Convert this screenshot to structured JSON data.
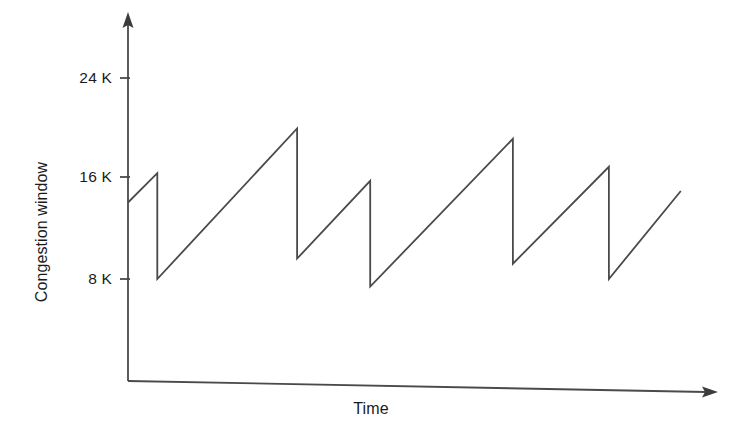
{
  "chart_data": {
    "type": "line",
    "title": "",
    "subtitle": "",
    "xlabel": "Time",
    "ylabel": "Congestion window",
    "grid": false,
    "legend": null,
    "legend_position": "none",
    "x": [
      0,
      0.05,
      0.05,
      0.289,
      0.289,
      0.414,
      0.414,
      0.658,
      0.658,
      0.822,
      0.822,
      0.945
    ],
    "y": [
      14.0,
      16.3,
      8.0,
      19.8,
      9.6,
      15.7,
      7.4,
      19.0,
      9.2,
      16.8,
      8.0,
      14.9
    ],
    "series": [
      {
        "name": "Congestion window",
        "points": [
          {
            "x": 0.0,
            "y": 14.0
          },
          {
            "x": 0.05,
            "y": 16.3
          },
          {
            "x": 0.05,
            "y": 8.0
          },
          {
            "x": 0.289,
            "y": 19.8
          },
          {
            "x": 0.289,
            "y": 9.6
          },
          {
            "x": 0.414,
            "y": 15.7
          },
          {
            "x": 0.414,
            "y": 7.4
          },
          {
            "x": 0.658,
            "y": 19.0
          },
          {
            "x": 0.658,
            "y": 9.2
          },
          {
            "x": 0.822,
            "y": 16.8
          },
          {
            "x": 0.822,
            "y": 8.0
          },
          {
            "x": 0.945,
            "y": 14.9
          }
        ]
      }
    ],
    "peaks": [
      16.3,
      19.8,
      15.7,
      19.0,
      16.8
    ],
    "troughs": [
      8.0,
      9.6,
      7.4,
      9.2,
      8.0
    ],
    "ytick_values": [
      8,
      16,
      24
    ],
    "ytick_labels": [
      "8 K",
      "16 K",
      "24 K"
    ],
    "xtick_labels": [],
    "ylim": [
      0,
      26
    ],
    "xlim": [
      0,
      1
    ],
    "axis_arrows": true,
    "line_color": "#4a4a4a",
    "axis_color": "#4a4a4a",
    "background_color": "#ffffff"
  },
  "axis": {
    "y_ticks": [
      {
        "label": "24 K",
        "value": 24
      },
      {
        "label": "16 K",
        "value": 16
      },
      {
        "label": "8 K",
        "value": 8
      }
    ],
    "y_title": "Congestion window",
    "x_title": "Time"
  }
}
